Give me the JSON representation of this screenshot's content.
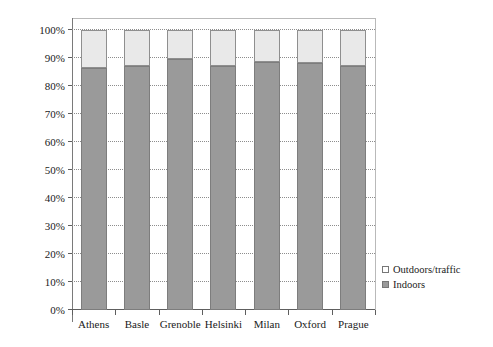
{
  "chart_data": {
    "type": "bar",
    "subtype": "stacked-100-percent",
    "title": "",
    "subtitle": "",
    "xlabel": "",
    "ylabel": "Percentage of time",
    "categories": [
      "Athens",
      "Basle",
      "Grenoble",
      "Helsinki",
      "Milan",
      "Oxford",
      "Prague"
    ],
    "series": [
      {
        "name": "Indoors",
        "color": "#9a9a9a",
        "values": [
          86.5,
          87.0,
          89.5,
          87.3,
          88.7,
          88.3,
          87.0
        ]
      },
      {
        "name": "Outdoors/traffic",
        "color": "#e9e9e9",
        "values": [
          13.5,
          13.0,
          10.5,
          12.7,
          11.3,
          11.7,
          13.0
        ]
      }
    ],
    "ylim": [
      0,
      100
    ],
    "ytick_values": [
      0,
      10,
      20,
      30,
      40,
      50,
      60,
      70,
      80,
      90,
      100
    ],
    "ytick_labels": [
      "0%",
      "10%",
      "20%",
      "30%",
      "40%",
      "50%",
      "60%",
      "70%",
      "80%",
      "90%",
      "100%"
    ],
    "grid": true,
    "grid_axis": "y",
    "grid_style": "dotted",
    "legend_position": "right-bottom",
    "legend_entries": [
      {
        "label": "Outdoors/traffic",
        "swatch": "light"
      },
      {
        "label": "Indoors",
        "swatch": "dark"
      }
    ]
  },
  "colors": {
    "indoors": "#9a9a9a",
    "outdoors": "#e9e9e9",
    "axis": "#5e5e5e",
    "grid": "#8d8d8d",
    "frame": "#b9b9b9",
    "text": "#1a1a1a"
  }
}
